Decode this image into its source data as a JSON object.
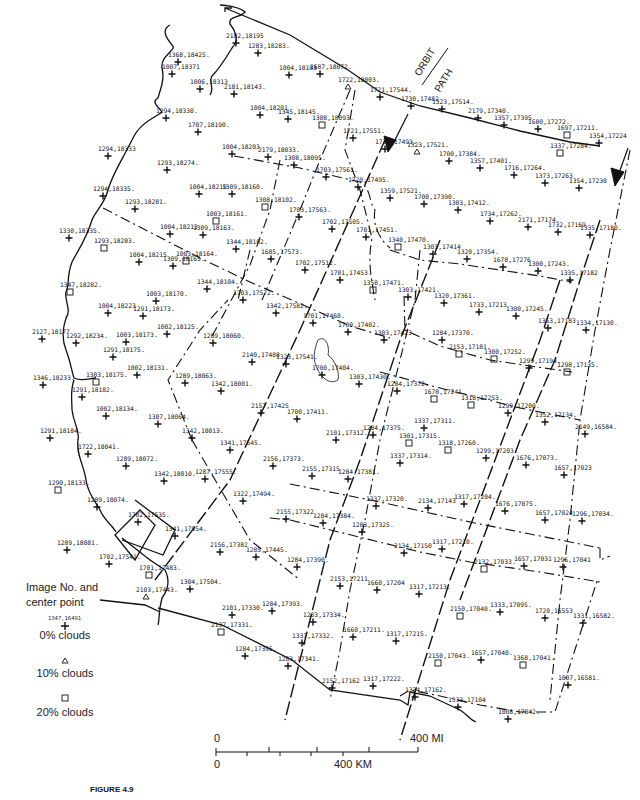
{
  "figure": {
    "caption": "FIGURE 4.9"
  },
  "orbit_label": {
    "line1": "ORBIT",
    "line2": "PATH"
  },
  "legend": {
    "title_line1": "Image No. and",
    "title_line2": "center point",
    "sample_label": "1347,16491",
    "items": [
      {
        "symbol": "cross",
        "label": "0% clouds"
      },
      {
        "symbol": "triangle",
        "label": "10% clouds"
      },
      {
        "symbol": "square",
        "label": "20% clouds"
      }
    ]
  },
  "scale_bar": {
    "mi_start": "0",
    "mi_end": "400 MI",
    "km_start": "0",
    "km_mid": "400 KM"
  },
  "points": [
    {
      "label": "2182,18195",
      "x": 236,
      "y": 43,
      "sym": "cross"
    },
    {
      "label": "1283,18283.",
      "x": 258,
      "y": 53,
      "sym": "cross"
    },
    {
      "label": "1368,18425.",
      "x": 178,
      "y": 62,
      "sym": "cross"
    },
    {
      "label": "1007,18371",
      "x": 172,
      "y": 74,
      "sym": "cross"
    },
    {
      "label": "1004,18183",
      "x": 289,
      "y": 75,
      "sym": "cross"
    },
    {
      "label": "1687,18072.",
      "x": 320,
      "y": 74,
      "sym": "cross"
    },
    {
      "label": "1722,18003.",
      "x": 348,
      "y": 87,
      "sym": "triangle"
    },
    {
      "label": "1006,18313",
      "x": 200,
      "y": 89,
      "sym": "cross"
    },
    {
      "label": "2181,18143.",
      "x": 234,
      "y": 94,
      "sym": "cross"
    },
    {
      "label": "1721,17544.",
      "x": 380,
      "y": 97,
      "sym": "cross"
    },
    {
      "label": "1730,17482",
      "x": 411,
      "y": 106,
      "sym": "cross"
    },
    {
      "label": "1323,17514.",
      "x": 442,
      "y": 109,
      "sym": "cross"
    },
    {
      "label": "2179,17340.",
      "x": 478,
      "y": 118,
      "sym": "cross"
    },
    {
      "label": "1357,17395",
      "x": 504,
      "y": 125,
      "sym": "cross"
    },
    {
      "label": "1680,17272.",
      "x": 538,
      "y": 129,
      "sym": "cross"
    },
    {
      "label": "1697,17211.",
      "x": 567,
      "y": 135,
      "sym": "square"
    },
    {
      "label": "1354,17224",
      "x": 599,
      "y": 143,
      "sym": "cross"
    },
    {
      "label": "1294,18330.",
      "x": 166,
      "y": 118,
      "sym": "cross"
    },
    {
      "label": "1004,18201",
      "x": 260,
      "y": 115,
      "sym": "cross"
    },
    {
      "label": "1345,18145.",
      "x": 288,
      "y": 119,
      "sym": "cross"
    },
    {
      "label": "1308,18093.",
      "x": 322,
      "y": 125,
      "sym": "square"
    },
    {
      "label": "1707,18190.",
      "x": 198,
      "y": 132,
      "sym": "cross"
    },
    {
      "label": "1721,17551.",
      "x": 353,
      "y": 138,
      "sym": "cross"
    },
    {
      "label": "1720,17493.",
      "x": 385,
      "y": 149,
      "sym": "cross"
    },
    {
      "label": "1323,17521.",
      "x": 417,
      "y": 152,
      "sym": "triangle"
    },
    {
      "label": "1337,17284.",
      "x": 560,
      "y": 153,
      "sym": "square"
    },
    {
      "label": "1700,17384.",
      "x": 449,
      "y": 161,
      "sym": "cross"
    },
    {
      "label": "1004,18203",
      "x": 232,
      "y": 154,
      "sym": "cross"
    },
    {
      "label": "2179,18033.",
      "x": 268,
      "y": 157,
      "sym": "cross"
    },
    {
      "label": "1294,18333",
      "x": 108,
      "y": 156,
      "sym": "cross"
    },
    {
      "label": "1308,18095.",
      "x": 294,
      "y": 165,
      "sym": "cross"
    },
    {
      "label": "1357,17401.",
      "x": 480,
      "y": 168,
      "sym": "cross"
    },
    {
      "label": "1703,17561.",
      "x": 326,
      "y": 177,
      "sym": "cross"
    },
    {
      "label": "1716,17264.",
      "x": 514,
      "y": 175,
      "sym": "cross"
    },
    {
      "label": "1293,18274.",
      "x": 167,
      "y": 170,
      "sym": "cross"
    },
    {
      "label": "1373,17263",
      "x": 545,
      "y": 183,
      "sym": "cross"
    },
    {
      "label": "1354,17230",
      "x": 579,
      "y": 188,
      "sym": "cross"
    },
    {
      "label": "1294,18335.",
      "x": 103,
      "y": 196,
      "sym": "cross"
    },
    {
      "label": "1004,18219",
      "x": 199,
      "y": 194,
      "sym": "cross"
    },
    {
      "label": "1309,18160.",
      "x": 232,
      "y": 194,
      "sym": "cross"
    },
    {
      "label": "1720,17495.",
      "x": 358,
      "y": 187,
      "sym": "cross"
    },
    {
      "label": "1359,17521.",
      "x": 390,
      "y": 198,
      "sym": "cross"
    },
    {
      "label": "1700,17390.",
      "x": 424,
      "y": 204,
      "sym": "cross"
    },
    {
      "label": "1303,17412.",
      "x": 458,
      "y": 210,
      "sym": "cross"
    },
    {
      "label": "1293,18281.",
      "x": 135,
      "y": 209,
      "sym": "cross"
    },
    {
      "label": "1308,18102.",
      "x": 265,
      "y": 207,
      "sym": "square"
    },
    {
      "label": "1003,18161.",
      "x": 216,
      "y": 221,
      "sym": "square"
    },
    {
      "label": "1734,17262.",
      "x": 490,
      "y": 221,
      "sym": "cross"
    },
    {
      "label": "2171,17174.",
      "x": 528,
      "y": 227,
      "sym": "cross"
    },
    {
      "label": "1732,17169",
      "x": 558,
      "y": 232,
      "sym": "cross"
    },
    {
      "label": "1335,17180.",
      "x": 590,
      "y": 235,
      "sym": "cross"
    },
    {
      "label": "1703,17563.",
      "x": 299,
      "y": 217,
      "sym": "cross"
    },
    {
      "label": "1004,18213",
      "x": 170,
      "y": 234,
      "sym": "cross"
    },
    {
      "label": "1309,18163.",
      "x": 203,
      "y": 235,
      "sym": "cross"
    },
    {
      "label": "1702,17505.",
      "x": 332,
      "y": 229,
      "sym": "cross"
    },
    {
      "label": "1701,17451.",
      "x": 366,
      "y": 237,
      "sym": "cross"
    },
    {
      "label": "1330,18335.",
      "x": 69,
      "y": 238,
      "sym": "cross"
    },
    {
      "label": "1293,18283.",
      "x": 104,
      "y": 248,
      "sym": "square"
    },
    {
      "label": "1003,18164.",
      "x": 186,
      "y": 261,
      "sym": "square"
    },
    {
      "label": "1344,18102.",
      "x": 236,
      "y": 249,
      "sym": "cross"
    },
    {
      "label": "1340,17470.",
      "x": 398,
      "y": 247,
      "sym": "square"
    },
    {
      "label": "1303,17414",
      "x": 433,
      "y": 254,
      "sym": "cross"
    },
    {
      "label": "1320,17354.",
      "x": 467,
      "y": 259,
      "sym": "cross"
    },
    {
      "label": "1678,17276",
      "x": 503,
      "y": 267,
      "sym": "cross"
    },
    {
      "label": "1300,17243.",
      "x": 538,
      "y": 271,
      "sym": "cross"
    },
    {
      "label": "1335,17182",
      "x": 570,
      "y": 280,
      "sym": "cross"
    },
    {
      "label": "1685,17573.",
      "x": 271,
      "y": 259,
      "sym": "cross"
    },
    {
      "label": "1004,18215",
      "x": 139,
      "y": 262,
      "sym": "cross"
    },
    {
      "label": "1309,18165.",
      "x": 173,
      "y": 266,
      "sym": "cross"
    },
    {
      "label": "1702,17512.",
      "x": 305,
      "y": 270,
      "sym": "cross"
    },
    {
      "label": "1701,17453.",
      "x": 340,
      "y": 280,
      "sym": "cross"
    },
    {
      "label": "1358,17471.",
      "x": 373,
      "y": 290,
      "sym": "square"
    },
    {
      "label": "1303,17421.",
      "x": 408,
      "y": 297,
      "sym": "cross"
    },
    {
      "label": "1320,17361.",
      "x": 444,
      "y": 303,
      "sym": "cross"
    },
    {
      "label": "1347,18282.",
      "x": 70,
      "y": 292,
      "sym": "square"
    },
    {
      "label": "1344,18104.",
      "x": 207,
      "y": 289,
      "sym": "cross"
    },
    {
      "label": "1703,17572.",
      "x": 243,
      "y": 300,
      "sym": "cross"
    },
    {
      "label": "1003,18170.",
      "x": 156,
      "y": 301,
      "sym": "cross"
    },
    {
      "label": "1733,17213",
      "x": 479,
      "y": 312,
      "sym": "cross"
    },
    {
      "label": "1300,17245.",
      "x": 516,
      "y": 316,
      "sym": "cross"
    },
    {
      "label": "1004,18223",
      "x": 108,
      "y": 313,
      "sym": "cross"
    },
    {
      "label": "1291,18173.",
      "x": 143,
      "y": 316,
      "sym": "cross"
    },
    {
      "label": "1342,17582.",
      "x": 276,
      "y": 313,
      "sym": "cross"
    },
    {
      "label": "1701,17460.",
      "x": 313,
      "y": 323,
      "sym": "cross"
    },
    {
      "label": "1700,17402.",
      "x": 348,
      "y": 332,
      "sym": "cross"
    },
    {
      "label": "1303,17423.",
      "x": 384,
      "y": 340,
      "sym": "cross"
    },
    {
      "label": "1353,17183",
      "x": 548,
      "y": 328,
      "sym": "cross"
    },
    {
      "label": "1334,17130.",
      "x": 586,
      "y": 330,
      "sym": "cross"
    },
    {
      "label": "2127,18177",
      "x": 42,
      "y": 339,
      "sym": "cross"
    },
    {
      "label": "1292,18234.",
      "x": 76,
      "y": 343,
      "sym": "cross"
    },
    {
      "label": "1003,18173.",
      "x": 126,
      "y": 342,
      "sym": "cross"
    },
    {
      "label": "1002,18125.",
      "x": 167,
      "y": 334,
      "sym": "cross"
    },
    {
      "label": "1289,18060.",
      "x": 213,
      "y": 343,
      "sym": "cross"
    },
    {
      "label": "1284,17370.",
      "x": 442,
      "y": 340,
      "sym": "cross"
    },
    {
      "label": "1291,18175.",
      "x": 113,
      "y": 357,
      "sym": "cross"
    },
    {
      "label": "2153,17181.",
      "x": 459,
      "y": 354,
      "sym": "square"
    },
    {
      "label": "1300,17252.",
      "x": 494,
      "y": 359,
      "sym": "square"
    },
    {
      "label": "1299,17194.",
      "x": 529,
      "y": 368,
      "sym": "cross"
    },
    {
      "label": "1298,17135.",
      "x": 567,
      "y": 372,
      "sym": "square"
    },
    {
      "label": "2140,17488",
      "x": 252,
      "y": 362,
      "sym": "cross"
    },
    {
      "label": "1323,17541.",
      "x": 286,
      "y": 364,
      "sym": "cross"
    },
    {
      "label": "1700,17404.",
      "x": 322,
      "y": 375,
      "sym": "cross"
    },
    {
      "label": "1002,18131.",
      "x": 137,
      "y": 375,
      "sym": "cross"
    },
    {
      "label": "1346,18233.",
      "x": 43,
      "y": 385,
      "sym": "cross"
    },
    {
      "label": "1303,18175.",
      "x": 96,
      "y": 382,
      "sym": "square"
    },
    {
      "label": "1291,18182.",
      "x": 82,
      "y": 397,
      "sym": "cross"
    },
    {
      "label": "1289,18063.",
      "x": 185,
      "y": 383,
      "sym": "cross"
    },
    {
      "label": "1342,18001.",
      "x": 221,
      "y": 391,
      "sym": "cross"
    },
    {
      "label": "1303,17430.",
      "x": 359,
      "y": 384,
      "sym": "cross"
    },
    {
      "label": "1284,17372.",
      "x": 397,
      "y": 391,
      "sym": "cross"
    },
    {
      "label": "1678,17241.",
      "x": 434,
      "y": 399,
      "sym": "square"
    },
    {
      "label": "1318,17253.",
      "x": 471,
      "y": 405,
      "sym": "square"
    },
    {
      "label": "1299,17200.",
      "x": 508,
      "y": 413,
      "sym": "cross"
    },
    {
      "label": "1352,17134.",
      "x": 545,
      "y": 422,
      "sym": "cross"
    },
    {
      "label": "2149,16584.",
      "x": 585,
      "y": 434,
      "sym": "cross"
    },
    {
      "label": "1002,18134.",
      "x": 106,
      "y": 416,
      "sym": "cross"
    },
    {
      "label": "1307,18064.",
      "x": 158,
      "y": 424,
      "sym": "cross"
    },
    {
      "label": "2157,17425",
      "x": 261,
      "y": 413,
      "sym": "cross"
    },
    {
      "label": "1700,17411.",
      "x": 297,
      "y": 419,
      "sym": "cross"
    },
    {
      "label": "1337,17311.",
      "x": 424,
      "y": 428,
      "sym": "cross"
    },
    {
      "label": "1291,18184.",
      "x": 50,
      "y": 438,
      "sym": "cross"
    },
    {
      "label": "1342,18013.",
      "x": 192,
      "y": 438,
      "sym": "cross"
    },
    {
      "label": "2101,17312.",
      "x": 336,
      "y": 440,
      "sym": "cross"
    },
    {
      "label": "1284,17375.",
      "x": 373,
      "y": 435,
      "sym": "cross"
    },
    {
      "label": "1301,17315.",
      "x": 409,
      "y": 443,
      "sym": "square"
    },
    {
      "label": "1722,18041.",
      "x": 88,
      "y": 454,
      "sym": "cross"
    },
    {
      "label": "1341,17545.",
      "x": 230,
      "y": 450,
      "sym": "cross"
    },
    {
      "label": "1318,17260.",
      "x": 448,
      "y": 450,
      "sym": "square"
    },
    {
      "label": "1337,17314.",
      "x": 400,
      "y": 463,
      "sym": "cross"
    },
    {
      "label": "1299,17203.",
      "x": 486,
      "y": 458,
      "sym": "cross"
    },
    {
      "label": "1676,17073.",
      "x": 526,
      "y": 465,
      "sym": "cross"
    },
    {
      "label": "1657,17023",
      "x": 564,
      "y": 475,
      "sym": "cross"
    },
    {
      "label": "1289,18072.",
      "x": 126,
      "y": 466,
      "sym": "cross"
    },
    {
      "label": "2156,17373.",
      "x": 273,
      "y": 466,
      "sym": "cross"
    },
    {
      "label": "2155,17315",
      "x": 312,
      "y": 476,
      "sym": "cross"
    },
    {
      "label": "1284,17381.",
      "x": 348,
      "y": 479,
      "sym": "cross"
    },
    {
      "label": "1342,18010.",
      "x": 164,
      "y": 481,
      "sym": "cross"
    },
    {
      "label": "1287,17555.",
      "x": 205,
      "y": 479,
      "sym": "cross"
    },
    {
      "label": "1290,18133.",
      "x": 58,
      "y": 490,
      "sym": "square"
    },
    {
      "label": "1322,17494.",
      "x": 243,
      "y": 501,
      "sym": "cross"
    },
    {
      "label": "1337,17320.",
      "x": 376,
      "y": 506,
      "sym": "cross"
    },
    {
      "label": "2134,17143",
      "x": 428,
      "y": 508,
      "sym": "cross"
    },
    {
      "label": "1317,17204.",
      "x": 464,
      "y": 504,
      "sym": "cross"
    },
    {
      "label": "1676,17075.",
      "x": 505,
      "y": 511,
      "sym": "cross"
    },
    {
      "label": "1657,17024",
      "x": 545,
      "y": 520,
      "sym": "cross"
    },
    {
      "label": "1296,17034.",
      "x": 582,
      "y": 521,
      "sym": "cross"
    },
    {
      "label": "1289,18074.",
      "x": 97,
      "y": 507,
      "sym": "cross"
    },
    {
      "label": "1702,17535.",
      "x": 138,
      "y": 522,
      "sym": "cross"
    },
    {
      "label": "2155,17322",
      "x": 286,
      "y": 519,
      "sym": "cross"
    },
    {
      "label": "1284,17384.",
      "x": 323,
      "y": 523,
      "sym": "cross"
    },
    {
      "label": "1283,17325.",
      "x": 362,
      "y": 532,
      "sym": "cross"
    },
    {
      "label": "1341,17554.",
      "x": 175,
      "y": 536,
      "sym": "cross"
    },
    {
      "label": "1289,18081.",
      "x": 67,
      "y": 550,
      "sym": "cross"
    },
    {
      "label": "2134,17150",
      "x": 404,
      "y": 553,
      "sym": "cross"
    },
    {
      "label": "1317,17210.",
      "x": 442,
      "y": 549,
      "sym": "cross"
    },
    {
      "label": "2156,17382",
      "x": 220,
      "y": 552,
      "sym": "cross"
    },
    {
      "label": "1285,17445.",
      "x": 256,
      "y": 557,
      "sym": "cross"
    },
    {
      "label": "1284,17390.",
      "x": 297,
      "y": 567,
      "sym": "cross"
    },
    {
      "label": "2132,17033.",
      "x": 484,
      "y": 569,
      "sym": "square"
    },
    {
      "label": "1657,17031",
      "x": 524,
      "y": 566,
      "sym": "cross"
    },
    {
      "label": "1296,17041",
      "x": 563,
      "y": 567,
      "sym": "cross"
    },
    {
      "label": "1702,17541.",
      "x": 109,
      "y": 564,
      "sym": "cross"
    },
    {
      "label": "1701,17483.",
      "x": 149,
      "y": 575,
      "sym": "square"
    },
    {
      "label": "1304,17504.",
      "x": 190,
      "y": 589,
      "sym": "cross"
    },
    {
      "label": "2103,17443.",
      "x": 146,
      "y": 597,
      "sym": "triangle"
    },
    {
      "label": "2153,17211",
      "x": 340,
      "y": 586,
      "sym": "cross"
    },
    {
      "label": "1660,17204",
      "x": 377,
      "y": 590,
      "sym": "cross"
    },
    {
      "label": "1317,17213.",
      "x": 419,
      "y": 594,
      "sym": "cross"
    },
    {
      "label": "2150,17040.",
      "x": 460,
      "y": 616,
      "sym": "square"
    },
    {
      "label": "1333,17095.",
      "x": 500,
      "y": 612,
      "sym": "cross"
    },
    {
      "label": "1720,16553",
      "x": 545,
      "y": 618,
      "sym": "cross"
    },
    {
      "label": "1331,16582.",
      "x": 583,
      "y": 623,
      "sym": "cross"
    },
    {
      "label": "2101,17330.",
      "x": 232,
      "y": 615,
      "sym": "cross"
    },
    {
      "label": "1284,17393.",
      "x": 272,
      "y": 611,
      "sym": "cross"
    },
    {
      "label": "1283,17334.",
      "x": 313,
      "y": 622,
      "sym": "cross"
    },
    {
      "label": "2137,17331.",
      "x": 221,
      "y": 632,
      "sym": "square"
    },
    {
      "label": "1660,17211.",
      "x": 353,
      "y": 637,
      "sym": "cross"
    },
    {
      "label": "1317,17215.",
      "x": 396,
      "y": 641,
      "sym": "cross"
    },
    {
      "label": "1337,17332.",
      "x": 302,
      "y": 643,
      "sym": "cross"
    },
    {
      "label": "2150,17043.",
      "x": 438,
      "y": 663,
      "sym": "square"
    },
    {
      "label": "1657,17040.",
      "x": 481,
      "y": 660,
      "sym": "cross"
    },
    {
      "label": "1368,17041.",
      "x": 523,
      "y": 665,
      "sym": "square"
    },
    {
      "label": "1284,17395.",
      "x": 245,
      "y": 656,
      "sym": "cross"
    },
    {
      "label": "1283,17341.",
      "x": 288,
      "y": 666,
      "sym": "cross"
    },
    {
      "label": "1007,16581.",
      "x": 568,
      "y": 685,
      "sym": "cross"
    },
    {
      "label": "2152,17162",
      "x": 332,
      "y": 688,
      "sym": "cross"
    },
    {
      "label": "1317,17222.",
      "x": 373,
      "y": 686,
      "sym": "cross"
    },
    {
      "label": "1334,17162.",
      "x": 415,
      "y": 697,
      "sym": "cross"
    },
    {
      "label": "1333,17104",
      "x": 458,
      "y": 707,
      "sym": "cross"
    },
    {
      "label": "1008,17042.",
      "x": 508,
      "y": 719,
      "sym": "cross"
    }
  ]
}
